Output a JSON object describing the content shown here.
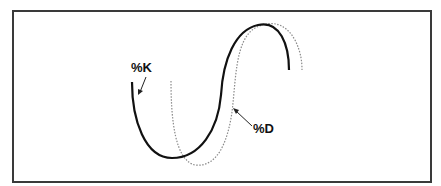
{
  "diagram": {
    "title": "",
    "background": "#ffffff",
    "frame_color": "#3a3a3a",
    "series": [
      {
        "name": "%K",
        "style": "solid",
        "color": "#111111",
        "description": "fast stochastic line, leads"
      },
      {
        "name": "%D",
        "style": "dotted",
        "color": "#888888",
        "description": "slow stochastic line, lags %K"
      }
    ],
    "labels": {
      "k": "%K",
      "d": "%D"
    },
    "annotations": [
      {
        "text": "%K",
        "points_to": "solid line"
      },
      {
        "text": "%D",
        "points_to": "dotted line"
      }
    ]
  }
}
